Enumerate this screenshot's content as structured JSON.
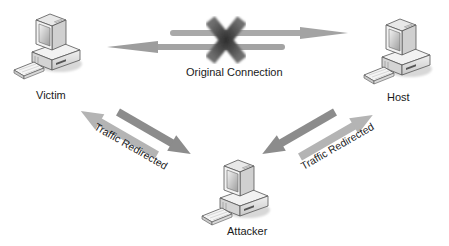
{
  "diagram": {
    "title": "",
    "nodes": [
      {
        "id": "victim",
        "label": "Victim",
        "icon": "desktop-computer-icon"
      },
      {
        "id": "host",
        "label": "Host",
        "icon": "desktop-computer-icon"
      },
      {
        "id": "attacker",
        "label": "Attacker",
        "icon": "desktop-computer-icon"
      }
    ],
    "edges": [
      {
        "from": "victim",
        "to": "host",
        "label": "Original Connection",
        "status": "broken",
        "marker": "x-icon"
      },
      {
        "from": "victim",
        "to": "attacker",
        "label": "Traffic Redirected",
        "bidirectional": true
      },
      {
        "from": "attacker",
        "to": "host",
        "label": "Traffic Redirected",
        "bidirectional": true
      }
    ],
    "colors": {
      "arrow_light": "#a9a9a9",
      "arrow_dark": "#8a8a8a",
      "x_mark": "#4a4a4a",
      "text": "#1a1a1a",
      "background": "#ffffff"
    }
  }
}
